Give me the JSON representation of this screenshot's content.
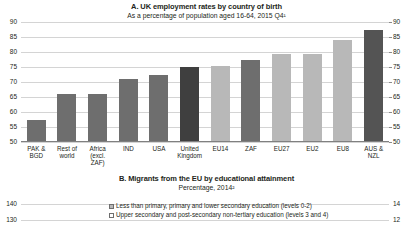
{
  "panel_a": {
    "title": "A. UK employment rates by country of birth",
    "subtitle": "As a percentage of population aged 16-64, 2015 Q4¹"
  },
  "panel_b": {
    "title": "B. Migrants from the EU by educational attainment",
    "subtitle": "Percentage, 2014²",
    "legend": [
      {
        "label": "Less than primary, primary and lower secondary education (levels 0-2)",
        "color": "#b8b8b8"
      },
      {
        "label": "Upper secondary and post-secondary non-tertiary education (levels 3 and 4)",
        "color": "#ffffff"
      }
    ],
    "y_ticks_left": [
      "140",
      "130"
    ],
    "y_ticks_right": [
      "14",
      "12"
    ]
  },
  "chart_data": [
    {
      "type": "bar",
      "title": "A. UK employment rates by country of birth",
      "subtitle": "As a percentage of population aged 16-64, 2015 Q4¹",
      "xlabel": "",
      "ylabel": "",
      "ylim": [
        50,
        90
      ],
      "yticks": [
        50,
        55,
        60,
        65,
        70,
        75,
        80,
        85,
        90
      ],
      "grid": true,
      "legend": "none",
      "dual_axis": true,
      "categories": [
        "PAK &\nBGD",
        "Rest of\nworld",
        "Africa\n(excl. ZAF)",
        "IND",
        "USA",
        "United\nKingdom",
        "EU14",
        "ZAF",
        "EU27",
        "EU2",
        "EU8",
        "AUS &\nNZL"
      ],
      "values": [
        57.5,
        66.0,
        66.0,
        71.0,
        72.5,
        75.0,
        75.5,
        77.5,
        79.5,
        79.5,
        84.0,
        87.5
      ],
      "bar_colors": [
        "#6e6e6e",
        "#6e6e6e",
        "#6e6e6e",
        "#6e6e6e",
        "#6e6e6e",
        "#3f3f3f",
        "#b8b8b8",
        "#6e6e6e",
        "#b8b8b8",
        "#b8b8b8",
        "#b8b8b8",
        "#545454"
      ]
    },
    {
      "type": "bar",
      "title": "B. Migrants from the EU by educational attainment",
      "subtitle": "Percentage, 2014²",
      "xlabel": "",
      "ylabel": "",
      "ylim": [
        120,
        140
      ],
      "yticks": [
        130,
        140
      ],
      "grid": true,
      "legend": "top",
      "series": [
        {
          "name": "Less than primary, primary and lower secondary education (levels 0-2)",
          "values": []
        },
        {
          "name": "Upper secondary and post-secondary non-tertiary education (levels 3 and 4)",
          "values": []
        }
      ],
      "note": "panel cropped at image bottom edge; only axis labels and legend visible"
    }
  ]
}
